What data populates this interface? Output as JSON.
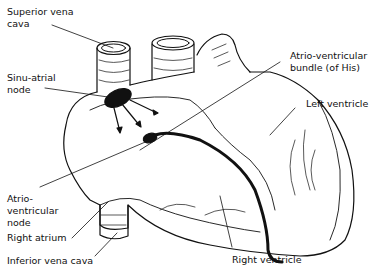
{
  "diagram": {
    "labels": {
      "superior_vena_cava": "Superior vena\ncava",
      "sinu_atrial_node": "Sinu-atrial\nnode",
      "atrio_ventricular_bundle": "Atrio-ventricular\nbundle (of His)",
      "left_ventricle": "Left ventricle",
      "atrio_ventricular_node": "Atrio-\nventricular\nnode",
      "right_atrium": "Right atrium",
      "inferior_vena_cava": "Inferior vena cava",
      "right_ventricle": "Right ventricle"
    },
    "colors": {
      "ink": "#111111",
      "background": "#ffffff"
    }
  }
}
